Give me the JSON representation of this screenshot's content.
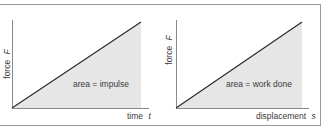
{
  "colors": {
    "frame": "#9a9a9a",
    "axis": "#8a8a8a",
    "line": "#2a2a2a",
    "fill": "#e6e6e6",
    "text": "#3a3a3a"
  },
  "panels": [
    {
      "ylabel": "force",
      "ylabel_var": "F",
      "xlabel": "time",
      "xlabel_var": "t",
      "area_label": "area = impulse"
    },
    {
      "ylabel": "force",
      "ylabel_var": "F",
      "xlabel": "displacement",
      "xlabel_var": "s",
      "area_label": "area = work done"
    }
  ]
}
